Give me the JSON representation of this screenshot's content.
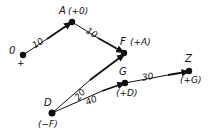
{
  "diagram": {
    "type": "weighted directed graph (Dijkstra labels)",
    "nodes": [
      {
        "id": "0",
        "label": "0",
        "annotation": "+",
        "x": 23,
        "y": 55
      },
      {
        "id": "A",
        "label": "A",
        "annotation": "(+0)",
        "x": 72,
        "y": 22
      },
      {
        "id": "F",
        "label": "F",
        "annotation": "(+A)",
        "x": 124,
        "y": 53
      },
      {
        "id": "G",
        "label": "G",
        "annotation": "(+D)",
        "x": 125,
        "y": 83
      },
      {
        "id": "Z",
        "label": "Z",
        "annotation": "(+G)",
        "x": 189,
        "y": 71
      },
      {
        "id": "D",
        "label": "D",
        "annotation": "(−F)",
        "x": 52,
        "y": 113
      }
    ],
    "edges": [
      {
        "from": "0",
        "to": "A",
        "weight": "10"
      },
      {
        "from": "A",
        "to": "F",
        "weight": "10"
      },
      {
        "from": "D",
        "to": "F",
        "weight": "20"
      },
      {
        "from": "D",
        "to": "G",
        "weight": "40"
      },
      {
        "from": "G",
        "to": "Z",
        "weight": "30"
      }
    ],
    "colors": {
      "ink": "#111111",
      "background": "#ffffff"
    }
  }
}
